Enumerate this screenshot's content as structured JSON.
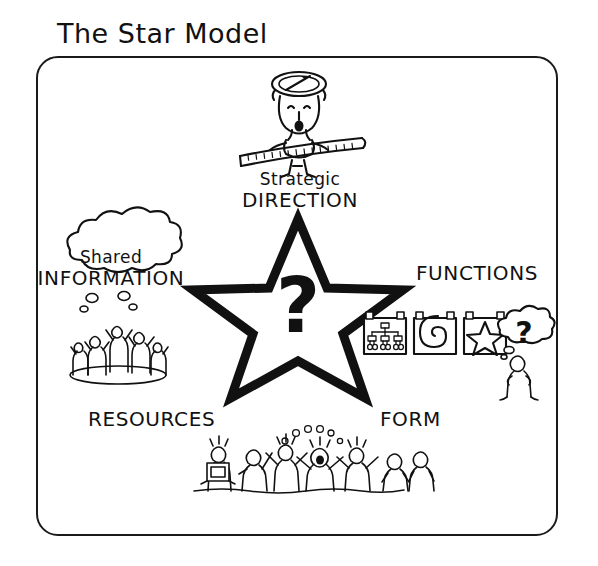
{
  "title": "The Star Model",
  "colors": {
    "background": "#ffffff",
    "ink": "#111111",
    "frame": "#1a1a1a"
  },
  "frame": {
    "name": "diagram-border"
  },
  "center": {
    "shape": "five-pointed-star",
    "symbol": "?"
  },
  "nodes": {
    "direction": {
      "line1": "Strategic",
      "line2": "DIRECTION",
      "position": "top",
      "illustration": "person-with-compass-hat-holding-measuring-tape"
    },
    "information": {
      "line1": "Shared",
      "line2": "INFORMATION",
      "position": "upper-left",
      "illustration": "thought-cloud-over-group-of-people"
    },
    "functions": {
      "line1": "FUNCTIONS",
      "position": "upper-right",
      "illustration": "three-posters-org-chart-spiral-star-with-questioning-person"
    },
    "resources": {
      "line1": "RESOURCES",
      "position": "lower-left"
    },
    "form": {
      "line1": "FORM",
      "position": "lower-right"
    },
    "bottom_illustration": {
      "illustration": "crowd-of-people-celebrating-with-raised-arms"
    }
  }
}
